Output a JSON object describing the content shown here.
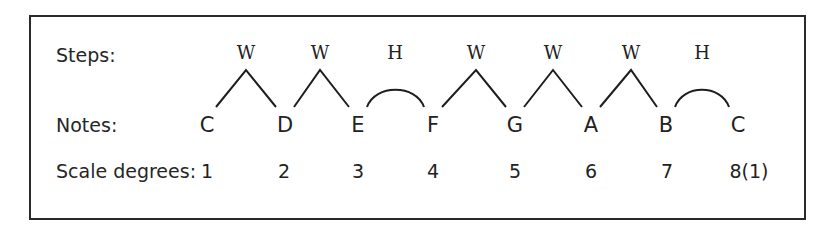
{
  "diagram": {
    "row_labels": {
      "steps": "Steps:",
      "notes": "Notes:",
      "degrees": "Scale degrees:"
    },
    "notes": [
      {
        "name": "C",
        "x": 207
      },
      {
        "name": "D",
        "x": 285
      },
      {
        "name": "E",
        "x": 358
      },
      {
        "name": "F",
        "x": 433
      },
      {
        "name": "G",
        "x": 515
      },
      {
        "name": "A",
        "x": 591
      },
      {
        "name": "B",
        "x": 666
      },
      {
        "name": "C",
        "x": 738
      }
    ],
    "steps": [
      {
        "label": "W",
        "type": "whole",
        "x": 246
      },
      {
        "label": "W",
        "type": "whole",
        "x": 320
      },
      {
        "label": "H",
        "type": "half",
        "x": 395
      },
      {
        "label": "W",
        "type": "whole",
        "x": 476
      },
      {
        "label": "W",
        "type": "whole",
        "x": 553
      },
      {
        "label": "W",
        "type": "whole",
        "x": 631
      },
      {
        "label": "H",
        "type": "half",
        "x": 702
      }
    ],
    "degrees": [
      {
        "label": "1",
        "x": 207
      },
      {
        "label": "2",
        "x": 284
      },
      {
        "label": "3",
        "x": 358
      },
      {
        "label": "4",
        "x": 433
      },
      {
        "label": "5",
        "x": 515
      },
      {
        "label": "6",
        "x": 591
      },
      {
        "label": "7",
        "x": 667
      },
      {
        "label": "8(1)",
        "x": 749
      }
    ]
  }
}
